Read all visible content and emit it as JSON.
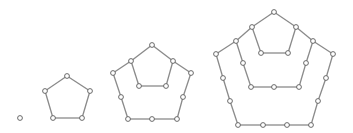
{
  "diagram": {
    "title": "",
    "colors": {
      "edge": "#8a8a8a",
      "node_fill": "#ffffff",
      "node_stroke": "#5a5a5a",
      "background": "#ffffff"
    },
    "node_radius": 2.4,
    "graphs": [
      {
        "name": "single-node",
        "nodes": [
          [
            20,
            118
          ]
        ],
        "edges": []
      },
      {
        "name": "pentagon-small",
        "nodes": [
          [
            67,
            76
          ],
          [
            90,
            91
          ],
          [
            82,
            118
          ],
          [
            53,
            118
          ],
          [
            45,
            91
          ]
        ],
        "edges": [
          [
            0,
            1
          ],
          [
            1,
            2
          ],
          [
            2,
            3
          ],
          [
            3,
            4
          ],
          [
            4,
            0
          ]
        ]
      },
      {
        "name": "pentagon-nested-2",
        "nodes": [
          [
            152,
            45
          ],
          [
            173,
            61
          ],
          [
            191,
            73
          ],
          [
            183,
            97
          ],
          [
            177,
            119
          ],
          [
            152,
            119
          ],
          [
            128,
            119
          ],
          [
            121,
            97
          ],
          [
            113,
            73
          ],
          [
            131,
            61
          ],
          [
            139,
            86
          ],
          [
            166,
            86
          ]
        ],
        "edges": [
          [
            0,
            1
          ],
          [
            1,
            2
          ],
          [
            2,
            3
          ],
          [
            3,
            4
          ],
          [
            4,
            5
          ],
          [
            5,
            6
          ],
          [
            6,
            7
          ],
          [
            7,
            8
          ],
          [
            8,
            9
          ],
          [
            9,
            0
          ],
          [
            9,
            10
          ],
          [
            10,
            11
          ],
          [
            11,
            1
          ]
        ]
      },
      {
        "name": "pentagon-nested-3",
        "nodes": [
          [
            274,
            12
          ],
          [
            296,
            27
          ],
          [
            313,
            41
          ],
          [
            333,
            54
          ],
          [
            326,
            78
          ],
          [
            318,
            101
          ],
          [
            311,
            125
          ],
          [
            287,
            125
          ],
          [
            263,
            125
          ],
          [
            238,
            125
          ],
          [
            230,
            101
          ],
          [
            223,
            78
          ],
          [
            216,
            54
          ],
          [
            236,
            41
          ],
          [
            252,
            27
          ],
          [
            261,
            53
          ],
          [
            288,
            53
          ],
          [
            306,
            63
          ],
          [
            299,
            87
          ],
          [
            274,
            87
          ],
          [
            251,
            87
          ],
          [
            243,
            63
          ]
        ],
        "edges": [
          [
            0,
            1
          ],
          [
            1,
            2
          ],
          [
            2,
            3
          ],
          [
            3,
            4
          ],
          [
            4,
            5
          ],
          [
            5,
            6
          ],
          [
            6,
            7
          ],
          [
            7,
            8
          ],
          [
            8,
            9
          ],
          [
            9,
            10
          ],
          [
            10,
            11
          ],
          [
            11,
            12
          ],
          [
            12,
            13
          ],
          [
            13,
            14
          ],
          [
            14,
            0
          ],
          [
            14,
            15
          ],
          [
            15,
            16
          ],
          [
            16,
            1
          ],
          [
            13,
            21
          ],
          [
            21,
            20
          ],
          [
            20,
            19
          ],
          [
            19,
            18
          ],
          [
            18,
            17
          ],
          [
            17,
            2
          ]
        ]
      }
    ]
  }
}
